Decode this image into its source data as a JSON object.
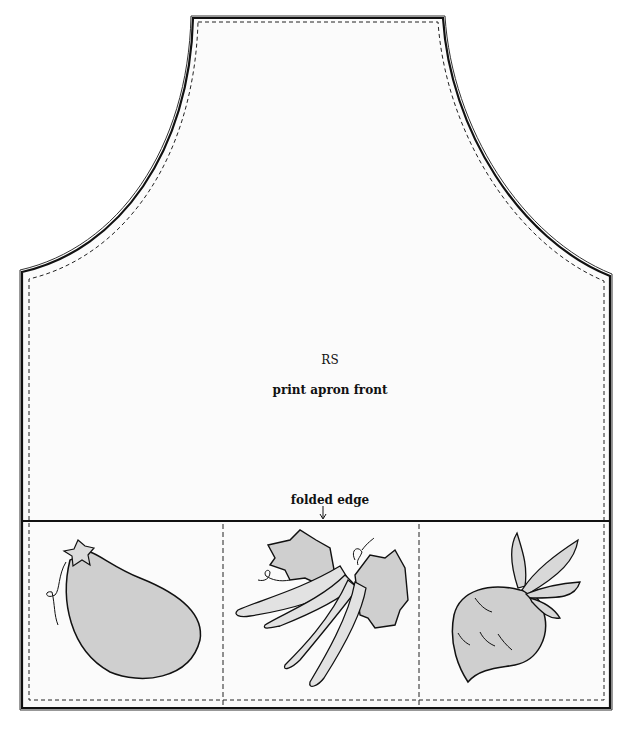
{
  "diagram": {
    "labels": {
      "side": "RS",
      "piece": "print apron front",
      "fold": "folded edge"
    },
    "pockets": [
      {
        "name": "eggplant",
        "label": "eggplant appliqué"
      },
      {
        "name": "pea-pods",
        "label": "pea pods and leaves appliqué"
      },
      {
        "name": "beet",
        "label": "beet/turnip appliqué"
      }
    ],
    "colors": {
      "outline": "#111111",
      "fabric": "#fbfbfb",
      "applique_fill": "#cfcfcf",
      "background": "#ffffff"
    }
  }
}
